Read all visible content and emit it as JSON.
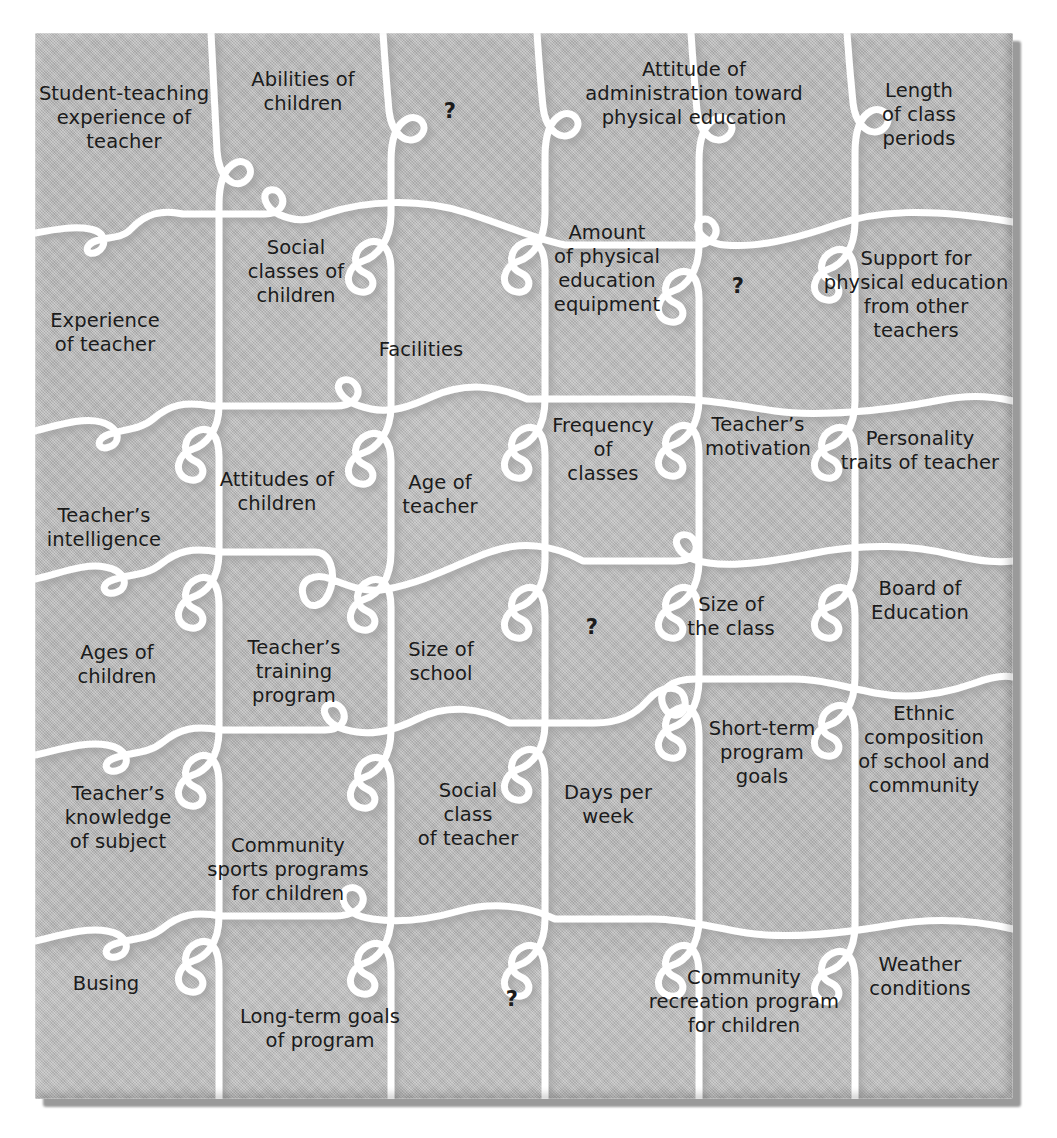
{
  "figure": {
    "type": "jigsaw-puzzle-diagram",
    "board_color": "#b9b9b9",
    "cut_color": "#ffffff",
    "text_color": "#1b1b1b",
    "shadow_color": "#9a9a9a",
    "rows": 6,
    "columns": 6,
    "unknown_marker": "?"
  },
  "pieces": [
    {
      "id": "student-teaching-experience-of-teacher",
      "label": "Student-teaching\nexperience of\nteacher",
      "x": 124,
      "y": 118
    },
    {
      "id": "abilities-of-children",
      "label": "Abilities of\nchildren",
      "x": 303,
      "y": 92
    },
    {
      "id": "unknown-1",
      "label": "?",
      "x": 450,
      "y": 112
    },
    {
      "id": "attitude-of-administration-toward-physical-education",
      "label": "Attitude of\nadministration toward\nphysical education",
      "x": 694,
      "y": 94
    },
    {
      "id": "length-of-class-periods",
      "label": "Length\nof class\nperiods",
      "x": 919,
      "y": 115
    },
    {
      "id": "social-classes-of-children",
      "label": "Social\nclasses of\nchildren",
      "x": 296,
      "y": 272
    },
    {
      "id": "amount-of-physical-education-equipment",
      "label": "Amount\nof physical\neducation\nequipment",
      "x": 607,
      "y": 269
    },
    {
      "id": "unknown-2",
      "label": "?",
      "x": 738,
      "y": 287
    },
    {
      "id": "support-for-physical-education-from-other-teachers",
      "label": "Support for\nphysical education\nfrom other\nteachers",
      "x": 916,
      "y": 295
    },
    {
      "id": "experience-of-teacher",
      "label": "Experience\nof teacher",
      "x": 105,
      "y": 333
    },
    {
      "id": "facilities",
      "label": "Facilities",
      "x": 421,
      "y": 350
    },
    {
      "id": "frequency-of-classes",
      "label": "Frequency\nof\nclasses",
      "x": 603,
      "y": 450
    },
    {
      "id": "teachers-motivation",
      "label": "Teacher’s\nmotivation",
      "x": 758,
      "y": 437
    },
    {
      "id": "personality-traits-of-teacher",
      "label": "Personality\ntraits of teacher",
      "x": 920,
      "y": 451
    },
    {
      "id": "attitudes-of-children",
      "label": "Attitudes of\nchildren",
      "x": 277,
      "y": 492
    },
    {
      "id": "age-of-teacher",
      "label": "Age of\nteacher",
      "x": 440,
      "y": 495
    },
    {
      "id": "teachers-intelligence",
      "label": "Teacher’s\nintelligence",
      "x": 104,
      "y": 528
    },
    {
      "id": "unknown-3",
      "label": "?",
      "x": 592,
      "y": 628
    },
    {
      "id": "size-of-the-class",
      "label": "Size of\nthe class",
      "x": 731,
      "y": 617
    },
    {
      "id": "board-of-education",
      "label": "Board of\nEducation",
      "x": 920,
      "y": 601
    },
    {
      "id": "ages-of-children",
      "label": "Ages of\nchildren",
      "x": 117,
      "y": 665
    },
    {
      "id": "teachers-training-program",
      "label": "Teacher’s\ntraining\nprogram",
      "x": 294,
      "y": 672
    },
    {
      "id": "size-of-school",
      "label": "Size of\nschool",
      "x": 441,
      "y": 662
    },
    {
      "id": "short-term-program-goals",
      "label": "Short-term\nprogram\ngoals",
      "x": 762,
      "y": 753
    },
    {
      "id": "ethnic-composition-of-school-and-community",
      "label": "Ethnic\ncomposition\nof school and\ncommunity",
      "x": 924,
      "y": 750
    },
    {
      "id": "teachers-knowledge-of-subject",
      "label": "Teacher’s\nknowledge\nof subject",
      "x": 118,
      "y": 818
    },
    {
      "id": "social-class-of-teacher",
      "label": "Social\nclass\nof teacher",
      "x": 468,
      "y": 815
    },
    {
      "id": "days-per-week",
      "label": "Days per\nweek",
      "x": 608,
      "y": 805
    },
    {
      "id": "community-sports-programs-for-children",
      "label": "Community\nsports programs\nfor children",
      "x": 288,
      "y": 870
    },
    {
      "id": "busing",
      "label": "Busing",
      "x": 106,
      "y": 984
    },
    {
      "id": "long-term-goals-of-program",
      "label": "Long-term goals\nof program",
      "x": 320,
      "y": 1029
    },
    {
      "id": "unknown-4",
      "label": "?",
      "x": 512,
      "y": 1000
    },
    {
      "id": "community-recreation-program-for-children",
      "label": "Community\nrecreation program\nfor children",
      "x": 744,
      "y": 1002
    },
    {
      "id": "weather-conditions",
      "label": "Weather\nconditions",
      "x": 920,
      "y": 977
    }
  ]
}
